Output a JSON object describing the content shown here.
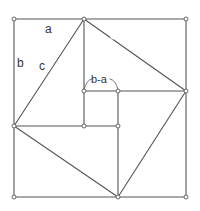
{
  "diagram": {
    "labels": {
      "a": "a",
      "b": "b",
      "c": "c",
      "b_minus_a": "b-a"
    },
    "colors": {
      "line": "#555555",
      "background": "#ffffff",
      "text": "#333333"
    },
    "outer_square": {
      "top_left": [
        14,
        19
      ],
      "top_right": [
        186,
        19
      ],
      "bottom_right": [
        186,
        197
      ],
      "bottom_left": [
        14,
        197
      ]
    },
    "tilted_square": {
      "top": [
        84,
        19
      ],
      "right": [
        186,
        91
      ],
      "bottom": [
        118,
        197
      ],
      "left": [
        14,
        126
      ]
    },
    "inner_square": {
      "top_left": [
        84,
        91
      ],
      "top_right": [
        118,
        91
      ],
      "bottom_right": [
        118,
        126
      ],
      "bottom_left": [
        84,
        126
      ]
    }
  }
}
